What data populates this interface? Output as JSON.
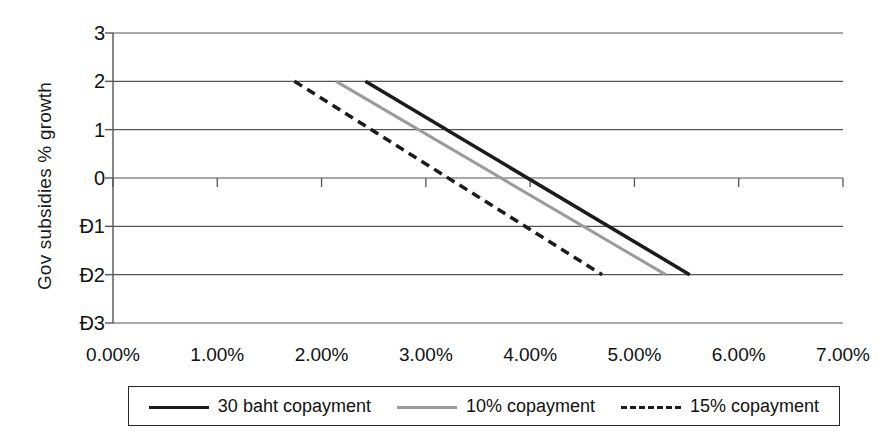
{
  "chart_data": {
    "type": "line",
    "title": "",
    "subtitle": "",
    "xlabel": "",
    "ylabel": "Gov subsidies % growth",
    "xlim": [
      0,
      7
    ],
    "ylim": [
      -3,
      3
    ],
    "grid": true,
    "grid_axis": "y",
    "legend_position": "bottom",
    "x_tick_labels": [
      "0.00%",
      "1.00%",
      "2.00%",
      "3.00%",
      "4.00%",
      "5.00%",
      "6.00%",
      "7.00%"
    ],
    "x_tick_values": [
      0,
      1,
      2,
      3,
      4,
      5,
      6,
      7
    ],
    "y_tick_labels": [
      "3",
      "2",
      "1",
      "0",
      "Đ1",
      "Đ2",
      "Đ3"
    ],
    "y_tick_values": [
      3,
      2,
      1,
      0,
      -1,
      -2,
      -3
    ],
    "series": [
      {
        "name": "30 baht copayment",
        "style": "solid",
        "color": "#1b1b1b",
        "width": 3.5,
        "x": [
          2.42,
          5.53
        ],
        "y": [
          2,
          -2
        ]
      },
      {
        "name": "10% copayment",
        "style": "solid",
        "color": "#9b9b9b",
        "width": 3.0,
        "x": [
          2.14,
          5.3
        ],
        "y": [
          2,
          -2
        ]
      },
      {
        "name": "15% copayment",
        "style": "dashed",
        "color": "#1b1b1b",
        "width": 3.5,
        "x": [
          1.74,
          4.69
        ],
        "y": [
          2,
          -2
        ]
      }
    ]
  },
  "legend": {
    "entries": [
      {
        "label": "30 baht copayment",
        "swatch": "solid-black"
      },
      {
        "label": "10% copayment",
        "swatch": "solid-gray"
      },
      {
        "label": "15% copayment",
        "swatch": "dashed-black"
      }
    ]
  },
  "colors": {
    "axis": "#555555",
    "grid": "#555555",
    "series_primary": "#1b1b1b",
    "series_secondary": "#9b9b9b",
    "legend_border": "#2a2a2a",
    "background": "#ffffff"
  }
}
